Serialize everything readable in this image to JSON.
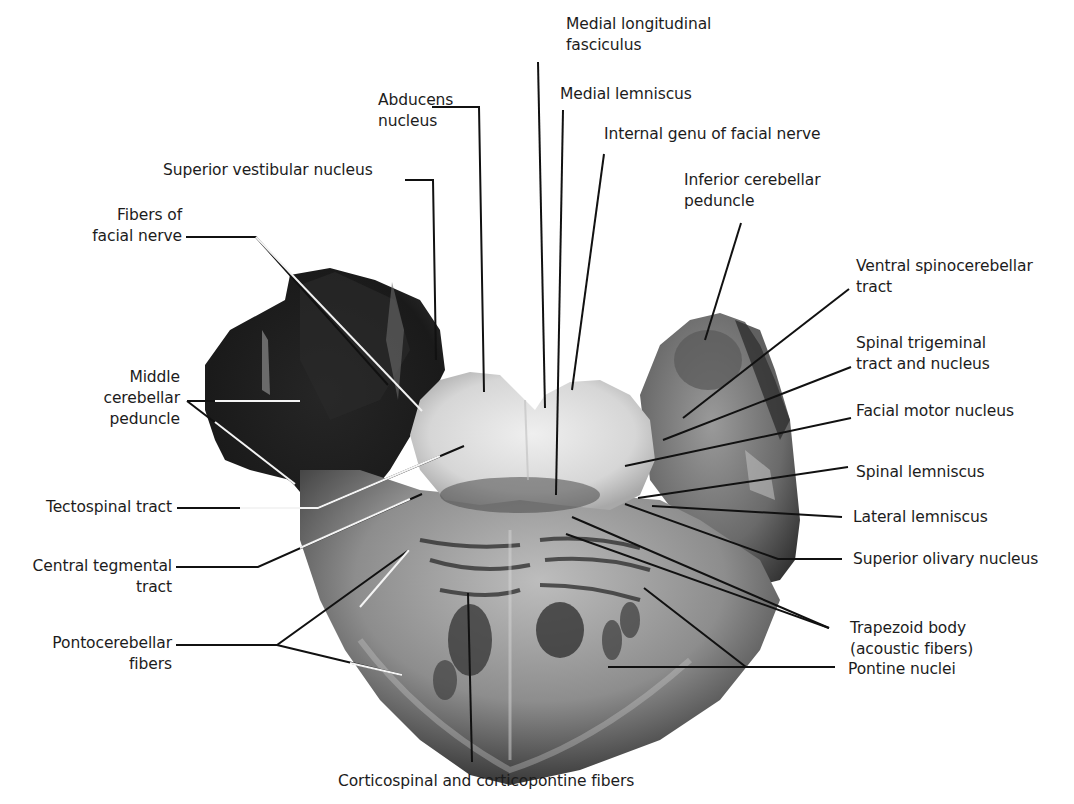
{
  "figure": {
    "colors": {
      "background": "#ffffff",
      "text": "#1c1c1c",
      "leader_line": "#111111",
      "specimen_dark": "#1e1e1e",
      "specimen_light": "#e6e6e6"
    }
  },
  "labels": {
    "medial_longitudinal_fasciculus": {
      "line1": "Medial longitudinal",
      "line2": "fasciculus"
    },
    "abducens_nucleus": {
      "line1": "Abducens",
      "line2": "nucleus"
    },
    "medial_lemniscus": {
      "line1": "Medial lemniscus"
    },
    "internal_genu_facial_nerve": {
      "line1": "Internal genu of facial nerve"
    },
    "superior_vestibular_nucleus": {
      "line1": "Superior vestibular nucleus"
    },
    "inferior_cerebellar_peduncle": {
      "line1": "Inferior cerebellar",
      "line2": "peduncle"
    },
    "fibers_of_facial_nerve": {
      "line1": "Fibers of",
      "line2": "facial nerve"
    },
    "ventral_spinocerebellar_tract": {
      "line1": "Ventral spinocerebellar",
      "line2": "tract"
    },
    "spinal_trigeminal": {
      "line1": "Spinal trigeminal",
      "line2": "tract and nucleus"
    },
    "middle_cerebellar_peduncle": {
      "line1": "Middle",
      "line2": "cerebellar",
      "line3": "peduncle"
    },
    "facial_motor_nucleus": {
      "line1": "Facial motor nucleus"
    },
    "spinal_lemniscus": {
      "line1": "Spinal lemniscus"
    },
    "tectospinal_tract": {
      "line1": "Tectospinal tract"
    },
    "lateral_lemniscus": {
      "line1": "Lateral lemniscus"
    },
    "central_tegmental_tract": {
      "line1": "Central tegmental",
      "line2": "tract"
    },
    "superior_olivary_nucleus": {
      "line1": "Superior olivary nucleus"
    },
    "pontocerebellar_fibers": {
      "line1": "Pontocerebellar",
      "line2": "fibers"
    },
    "trapezoid_body": {
      "line1": "Trapezoid body",
      "line2": "(acoustic fibers)"
    },
    "pontine_nuclei": {
      "line1": "Pontine nuclei"
    },
    "corticospinal_corticopontine": {
      "line1": "Corticospinal and corticopontine fibers"
    }
  }
}
